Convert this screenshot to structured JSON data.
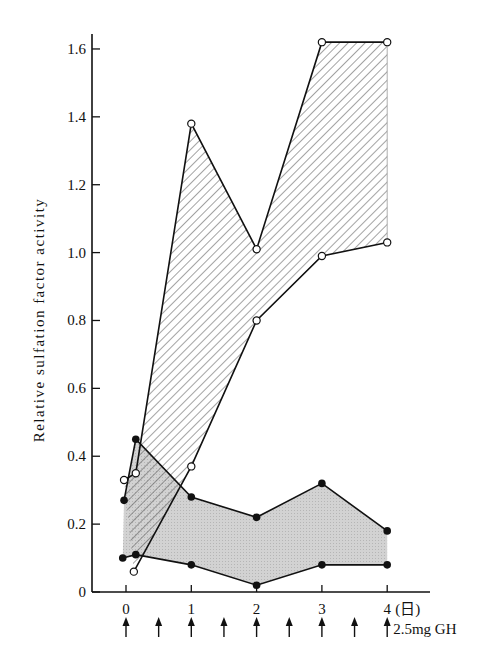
{
  "chart_data": {
    "type": "area",
    "title": "",
    "xlabel": "(日)",
    "ylabel": "Relative sulfation factor activity",
    "x_ticks": [
      "0",
      "1",
      "2",
      "3",
      "4"
    ],
    "y_ticks": [
      "0",
      "0.2",
      "0.4",
      "0.6",
      "0.8",
      "1.0",
      "1.2",
      "1.4",
      "1.6"
    ],
    "xlim": [
      -0.3,
      4.3
    ],
    "ylim": [
      0,
      1.65
    ],
    "annotation": "2.5mg GH",
    "injection_times": [
      0,
      0.5,
      1,
      1.5,
      2,
      2.5,
      3,
      3.5,
      4
    ],
    "series": [
      {
        "name": "open-circle upper bound (hatched band)",
        "marker": "open",
        "x": [
          -0.03,
          0.15,
          1,
          2,
          3,
          4
        ],
        "values": [
          0.33,
          0.35,
          1.38,
          1.01,
          1.62,
          1.62
        ]
      },
      {
        "name": "open-circle lower bound (hatched band)",
        "marker": "open",
        "x": [
          0.12,
          1,
          2,
          3,
          4
        ],
        "values": [
          0.06,
          0.37,
          0.8,
          0.99,
          1.03
        ]
      },
      {
        "name": "filled-circle upper bound (gray band)",
        "marker": "filled",
        "x": [
          -0.03,
          0.15,
          1,
          2,
          3,
          4
        ],
        "values": [
          0.27,
          0.45,
          0.28,
          0.22,
          0.32,
          0.18
        ]
      },
      {
        "name": "filled-circle lower bound (gray band)",
        "marker": "filled",
        "x": [
          -0.05,
          0.15,
          1,
          2,
          3,
          4
        ],
        "values": [
          0.1,
          0.11,
          0.08,
          0.02,
          0.08,
          0.08
        ]
      }
    ],
    "grid": false,
    "legend": "none"
  },
  "labels": {
    "ylabel": "Relative sulfation factor activity",
    "xunit": "(日)",
    "annotation": "2.5mg GH",
    "xticks": [
      "0",
      "1",
      "2",
      "3",
      "4"
    ],
    "yticks": [
      "0",
      "0.2",
      "0.4",
      "0.6",
      "0.8",
      "1.0",
      "1.2",
      "1.4",
      "1.6"
    ]
  }
}
